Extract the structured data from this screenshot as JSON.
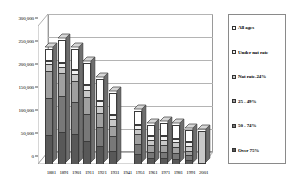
{
  "chart_data": {
    "type": "bar",
    "subtype": "stacked-column-3d",
    "title": "",
    "xlabel": "",
    "ylabel": "",
    "ylim": [
      0,
      300000
    ],
    "ytick_values": [
      0,
      50000,
      100000,
      150000,
      200000,
      250000,
      300000
    ],
    "ytick_labels": [
      "0",
      "50,000",
      "100,000",
      "150,000",
      "200,000",
      "250,000",
      "300,000"
    ],
    "grid": true,
    "legend_position": "right",
    "categories": [
      "1881",
      "1891",
      "1901",
      "1911",
      "1921",
      "1931",
      "1941",
      "1951",
      "1961",
      "1971",
      "1981",
      "1991",
      "2001"
    ],
    "series": [
      {
        "name": "All ages",
        "color": "#ffffff",
        "values": [
          25000,
          50000,
          45000,
          48000,
          48000,
          48000,
          0,
          30000,
          25000,
          30000,
          30000,
          28000,
          0
        ]
      },
      {
        "name": "Under nat rate",
        "color": "#f2f2f2",
        "values": [
          8000,
          8000,
          10000,
          10000,
          10000,
          10000,
          0,
          8000,
          8000,
          8000,
          8000,
          8000,
          0
        ]
      },
      {
        "name": "Nat rate-24%",
        "color": "#c8c8c8",
        "values": [
          14000,
          15000,
          15000,
          16000,
          16000,
          14000,
          0,
          12000,
          10000,
          10000,
          10000,
          10000,
          72000
        ]
      },
      {
        "name": "25 - 49%",
        "color": "#a0a0a0",
        "values": [
          60000,
          50000,
          45000,
          38000,
          30000,
          22000,
          0,
          22000,
          15000,
          15000,
          14000,
          10000,
          0
        ]
      },
      {
        "name": "50 - 74%",
        "color": "#787878",
        "values": [
          80000,
          78000,
          70000,
          58000,
          42000,
          32000,
          0,
          22000,
          14000,
          14000,
          12000,
          10000,
          0
        ]
      },
      {
        "name": "Over 75%",
        "color": "#585858",
        "values": [
          63000,
          69000,
          65000,
          50000,
          39000,
          29000,
          0,
          21000,
          13000,
          13000,
          11000,
          9000,
          0
        ]
      }
    ],
    "category_totals": [
      250000,
      270000,
      250000,
      220000,
      185000,
      155000,
      0,
      115000,
      85000,
      90000,
      85000,
      75000,
      72000
    ]
  },
  "legend": {
    "items": [
      {
        "label": "All ages"
      },
      {
        "label": "Under nat rate"
      },
      {
        "label": "Nat rate-24%"
      },
      {
        "label": "25 - 49%"
      },
      {
        "label": "50 - 74%"
      },
      {
        "label": "Over 75%"
      }
    ]
  },
  "colors": {
    "grid": "#b4b4b4",
    "frame": "#9a9a9a",
    "bar_outline": "#3c3c3c",
    "background": "#ffffff"
  }
}
